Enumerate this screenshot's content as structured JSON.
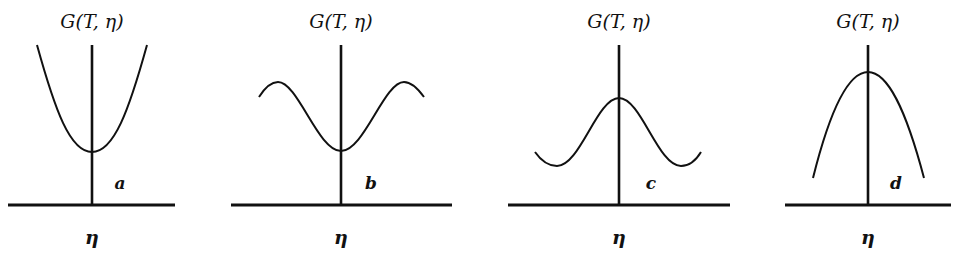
{
  "figure": {
    "panels": [
      {
        "id": "a",
        "y_label": "G(T, η)",
        "x_label": "η",
        "tag": "a",
        "shape": "single minimum at η=0 (upward parabola)",
        "axes": {
          "h": [
            8,
            175,
            205
          ],
          "v": [
            92,
            45,
            205
          ]
        },
        "path": "M37,45 C55,110 70,152 92,152 C114,152 129,110 147,45",
        "title_pos": [
          92,
          28
        ],
        "tag_pos": [
          120,
          189
        ],
        "eta_pos": [
          92,
          244
        ]
      },
      {
        "id": "b",
        "y_label": "G(T, η)",
        "x_label": "η",
        "tag": "b",
        "shape": "local minimum at η=0 with maxima on both sides",
        "axes": {
          "h": [
            231,
            452,
            205
          ],
          "v": [
            341,
            45,
            205
          ]
        },
        "path": "M259,97 C266,86 272,82 278,82 C298,82 318,151 341,151 C364,151 384,82 404,82 C410,82 416,86 424,97",
        "title_pos": [
          341,
          28
        ],
        "tag_pos": [
          371,
          189
        ],
        "eta_pos": [
          341,
          244
        ]
      },
      {
        "id": "c",
        "y_label": "G(T, η)",
        "x_label": "η",
        "tag": "c",
        "shape": "local maximum at η=0 with minima on both sides",
        "axes": {
          "h": [
            508,
            730,
            205
          ],
          "v": [
            619,
            45,
            205
          ]
        },
        "path": "M535,152 C542,162 550,166 557,166 C580,166 597,98 619,98 C641,98 658,166 681,166 C688,166 695,162 701,152",
        "title_pos": [
          619,
          28
        ],
        "tag_pos": [
          651,
          189
        ],
        "eta_pos": [
          619,
          244
        ]
      },
      {
        "id": "d",
        "y_label": "G(T, η)",
        "x_label": "η",
        "tag": "d",
        "shape": "single maximum at η=0 (downward parabola)",
        "axes": {
          "h": [
            785,
            951,
            205
          ],
          "v": [
            868,
            45,
            205
          ]
        },
        "path": "M813,178 C830,110 848,72 868,72 C888,72 906,110 924,178",
        "title_pos": [
          868,
          28
        ],
        "tag_pos": [
          896,
          189
        ],
        "eta_pos": [
          868,
          244
        ]
      }
    ],
    "colors": {
      "ink": "#111111",
      "background": "#ffffff"
    }
  }
}
